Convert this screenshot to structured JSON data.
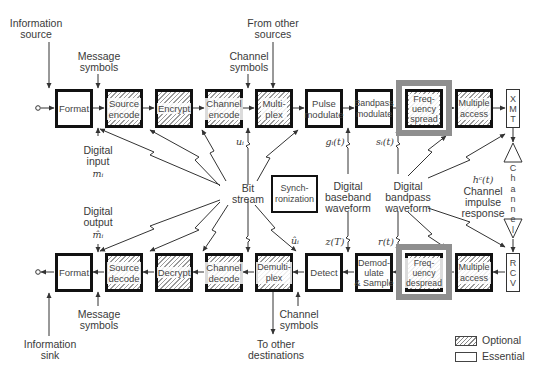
{
  "diagram": {
    "transmit_chain": [
      {
        "id": "format",
        "label": "Format",
        "kind": "essential"
      },
      {
        "id": "source-encode",
        "label": "Source\nencode",
        "kind": "optional"
      },
      {
        "id": "encrypt",
        "label": "Encrypt",
        "kind": "optional"
      },
      {
        "id": "channel-encode",
        "label": "Channel\nencode",
        "kind": "optional"
      },
      {
        "id": "multiplex",
        "label": "Multi-\nplex",
        "kind": "optional"
      },
      {
        "id": "pulse-modulate",
        "label": "Pulse\nmodulate",
        "kind": "essential"
      },
      {
        "id": "bandpass-modulate",
        "label": "Bandpass\nmodulate",
        "kind": "essential"
      },
      {
        "id": "frequency-spread",
        "label": "Freq-\nuency\nspread",
        "kind": "optional",
        "highlighted": true
      },
      {
        "id": "multiple-access",
        "label": "Multiple\naccess",
        "kind": "optional"
      },
      {
        "id": "xmt",
        "label": "X\nM\nT",
        "kind": "essential"
      }
    ],
    "receive_chain": [
      {
        "id": "format",
        "label": "Format",
        "kind": "essential"
      },
      {
        "id": "source-decode",
        "label": "Source\ndecode",
        "kind": "optional"
      },
      {
        "id": "decrypt",
        "label": "Decrypt",
        "kind": "optional"
      },
      {
        "id": "channel-decode",
        "label": "Channel\ndecode",
        "kind": "optional"
      },
      {
        "id": "demultiplex",
        "label": "Demulti-\nplex",
        "kind": "optional"
      },
      {
        "id": "detect",
        "label": "Detect",
        "kind": "essential"
      },
      {
        "id": "demodulate-sample",
        "label": "Demod-\nulate\n& Sample",
        "kind": "essential"
      },
      {
        "id": "frequency-despread",
        "label": "Freq-\nuency\ndespread",
        "kind": "optional",
        "highlighted": true
      },
      {
        "id": "multiple-access",
        "label": "Multiple\naccess",
        "kind": "optional"
      },
      {
        "id": "rcv",
        "label": "R\nC\nV",
        "kind": "essential"
      }
    ],
    "synchronization": {
      "label": "Synch-\nronization",
      "kind": "essential"
    },
    "channel": {
      "label": "C\nh\na\nn\nn\ne\nl"
    },
    "annotations": {
      "information_source": "Information\nsource",
      "information_sink": "Information\nsink",
      "message_symbols_top": "Message\nsymbols",
      "message_symbols_bottom": "Message\nsymbols",
      "channel_symbols_top": "Channel\nsymbols",
      "channel_symbols_bottom": "Channel\nsymbols",
      "from_other_sources": "From other\nsources",
      "to_other_destinations": "To other\ndestinations",
      "digital_input": "Digital\ninput",
      "digital_input_math": "mᵢ",
      "digital_output": "Digital\noutput",
      "digital_output_math": "m̂ᵢ",
      "bit_stream": "Bit\nstream",
      "u_i": "uᵢ",
      "u_hat_i": "ûᵢ",
      "g_i_t": "gᵢ(t)",
      "z_T": "z(T)",
      "s_i_t": "sᵢ(t)",
      "r_t": "r(t)",
      "h_c_t": "hᶜ(t)",
      "digital_baseband_waveform": "Digital\nbaseband\nwaveform",
      "digital_bandpass_waveform": "Digital\nbandpass\nwaveform",
      "channel_impulse_response": "Channel\nimpulse\nresponse"
    },
    "legend": [
      {
        "label": "Optional",
        "style": "hatched"
      },
      {
        "label": "Essential",
        "style": "plain"
      }
    ],
    "colors": {
      "block_border": "#111111",
      "highlight_frame": "#8f8f8f",
      "hatch": "#9a9a9a",
      "text": "#3a3a3a",
      "arrow": "#333333"
    }
  }
}
